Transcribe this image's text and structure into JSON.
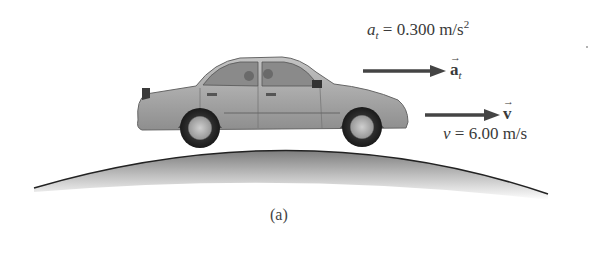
{
  "figure": {
    "caption": "(a)",
    "tangential_acceleration": {
      "symbol": "a",
      "subscript": "t",
      "equals": " = 0.300 m/s",
      "exponent": "2",
      "vector_label": "a",
      "vector_subscript": "t"
    },
    "velocity": {
      "symbol": "v",
      "equals": " = 6.00 m/s",
      "vector_label": "v"
    },
    "colors": {
      "arrow": "#444444",
      "hill_edge": "#222222",
      "car_body": "#a8a8a8"
    }
  }
}
